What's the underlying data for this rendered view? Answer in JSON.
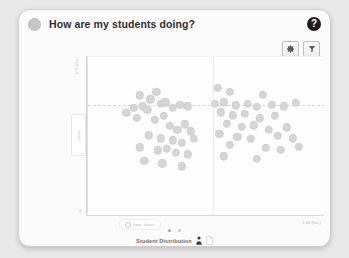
{
  "header": {
    "status_icon": "status-dot-icon",
    "title": "How are my students doing?",
    "help_label": "?"
  },
  "toolbar": {
    "buttons": [
      {
        "name": "settings",
        "icon": "gear-icon"
      },
      {
        "name": "filter",
        "icon": "funnel-icon"
      }
    ]
  },
  "axes": {
    "y_tick_top": "370 (pts.)",
    "y_origin": "0",
    "y_label": "score",
    "x_pill_label": "time, hours",
    "x_end_label": "1.49 (hrs.)"
  },
  "pager": {
    "dots": 2,
    "active_index": 0
  },
  "footer": {
    "label": "Student Distribution",
    "icons": [
      "person-icon",
      "document-icon"
    ]
  },
  "colors": {
    "card_bg": "#fbfbfb",
    "page_bg": "#e8e8e8",
    "marker": "#d6d6d6",
    "reference_line": "#d9cfc2",
    "help_bg": "#1d1d1d"
  },
  "chart_data": {
    "type": "scatter",
    "title": "How are my students doing?",
    "xlabel": "time, hours",
    "ylabel": "score",
    "xlim": [
      0,
      1.49
    ],
    "ylim": [
      0,
      370
    ],
    "grid": false,
    "legend": "Student Distribution",
    "reference_lines": {
      "horizontal_y": 266,
      "vertical_x": 0.79
    },
    "points": [
      {
        "x": 0.3,
        "y": 290
      },
      {
        "x": 0.37,
        "y": 280
      },
      {
        "x": 0.41,
        "y": 300
      },
      {
        "x": 0.26,
        "y": 258
      },
      {
        "x": 0.32,
        "y": 262
      },
      {
        "x": 0.35,
        "y": 252
      },
      {
        "x": 0.44,
        "y": 268
      },
      {
        "x": 0.47,
        "y": 272
      },
      {
        "x": 0.52,
        "y": 258
      },
      {
        "x": 0.57,
        "y": 266
      },
      {
        "x": 0.62,
        "y": 262
      },
      {
        "x": 0.21,
        "y": 244
      },
      {
        "x": 0.28,
        "y": 232
      },
      {
        "x": 0.4,
        "y": 226
      },
      {
        "x": 0.46,
        "y": 236
      },
      {
        "x": 0.5,
        "y": 210
      },
      {
        "x": 0.55,
        "y": 200
      },
      {
        "x": 0.6,
        "y": 214
      },
      {
        "x": 0.64,
        "y": 196
      },
      {
        "x": 0.36,
        "y": 186
      },
      {
        "x": 0.44,
        "y": 178
      },
      {
        "x": 0.52,
        "y": 172
      },
      {
        "x": 0.58,
        "y": 166
      },
      {
        "x": 0.66,
        "y": 176
      },
      {
        "x": 0.3,
        "y": 154
      },
      {
        "x": 0.42,
        "y": 146
      },
      {
        "x": 0.48,
        "y": 150
      },
      {
        "x": 0.54,
        "y": 140
      },
      {
        "x": 0.62,
        "y": 136
      },
      {
        "x": 0.33,
        "y": 118
      },
      {
        "x": 0.45,
        "y": 112
      },
      {
        "x": 0.58,
        "y": 104
      },
      {
        "x": 0.82,
        "y": 310
      },
      {
        "x": 0.9,
        "y": 300
      },
      {
        "x": 1.12,
        "y": 292
      },
      {
        "x": 0.8,
        "y": 268
      },
      {
        "x": 0.86,
        "y": 272
      },
      {
        "x": 0.94,
        "y": 264
      },
      {
        "x": 1.02,
        "y": 268
      },
      {
        "x": 1.08,
        "y": 260
      },
      {
        "x": 1.18,
        "y": 266
      },
      {
        "x": 1.26,
        "y": 262
      },
      {
        "x": 1.34,
        "y": 270
      },
      {
        "x": 0.84,
        "y": 246
      },
      {
        "x": 0.92,
        "y": 238
      },
      {
        "x": 1.0,
        "y": 242
      },
      {
        "x": 1.1,
        "y": 230
      },
      {
        "x": 1.2,
        "y": 236
      },
      {
        "x": 0.88,
        "y": 216
      },
      {
        "x": 0.98,
        "y": 208
      },
      {
        "x": 1.06,
        "y": 212
      },
      {
        "x": 1.16,
        "y": 200
      },
      {
        "x": 1.28,
        "y": 206
      },
      {
        "x": 0.83,
        "y": 190
      },
      {
        "x": 0.95,
        "y": 182
      },
      {
        "x": 1.04,
        "y": 176
      },
      {
        "x": 1.22,
        "y": 184
      },
      {
        "x": 1.32,
        "y": 178
      },
      {
        "x": 0.9,
        "y": 160
      },
      {
        "x": 1.14,
        "y": 152
      },
      {
        "x": 1.24,
        "y": 148
      },
      {
        "x": 1.36,
        "y": 156
      },
      {
        "x": 0.86,
        "y": 130
      },
      {
        "x": 1.08,
        "y": 124
      }
    ]
  }
}
